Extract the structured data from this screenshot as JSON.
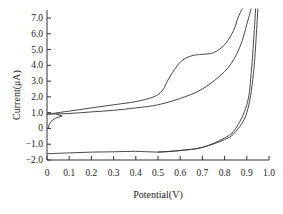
{
  "chart_data": {
    "type": "line",
    "title": "",
    "xlabel": "Potential(V)",
    "ylabel": "Current(μA)",
    "xlim": [
      0,
      1.0
    ],
    "ylim": [
      -2.0,
      7.0
    ],
    "x_ticks": [
      "0",
      "0.1",
      "0.2",
      "0.3",
      "0.4",
      "0.5",
      "0.6",
      "0.7",
      "0.8",
      "0.9",
      "1.0"
    ],
    "y_ticks": [
      "7.0",
      "6.0",
      "5.0",
      "4.0",
      "3.0",
      "2.0",
      "1.0",
      "0",
      "-1.0",
      "-2.0"
    ],
    "grid": false,
    "legend": null,
    "series": [
      {
        "name": "CV scan 1 (with oxidation peak)",
        "x": [
          0.0,
          0.05,
          0.1,
          0.2,
          0.3,
          0.4,
          0.48,
          0.52,
          0.55,
          0.6,
          0.65,
          0.7,
          0.75,
          0.8,
          0.84,
          0.86,
          0.88
        ],
        "y": [
          0.9,
          1.0,
          1.1,
          1.3,
          1.5,
          1.7,
          2.0,
          2.4,
          3.2,
          4.2,
          4.6,
          4.7,
          4.8,
          5.3,
          6.2,
          7.0,
          7.6
        ]
      },
      {
        "name": "CV scan 2 (return / baseline)",
        "x": [
          0.0,
          0.1,
          0.2,
          0.3,
          0.4,
          0.5,
          0.6,
          0.7,
          0.8,
          0.85,
          0.88,
          0.9,
          0.92
        ],
        "y": [
          0.9,
          0.95,
          1.05,
          1.15,
          1.3,
          1.5,
          1.9,
          2.5,
          3.6,
          4.6,
          5.6,
          6.6,
          7.6
        ]
      },
      {
        "name": "Cathodic scan",
        "x": [
          0.0,
          0.1,
          0.2,
          0.3,
          0.4,
          0.5,
          0.6,
          0.7,
          0.8,
          0.85,
          0.9,
          0.93,
          0.95
        ],
        "y": [
          -1.6,
          -1.55,
          -1.5,
          -1.48,
          -1.45,
          -1.5,
          -1.4,
          -1.2,
          -0.7,
          -0.2,
          1.0,
          3.5,
          7.6
        ]
      },
      {
        "name": "Anodic scan (high potential)",
        "x": [
          0.5,
          0.6,
          0.7,
          0.8,
          0.85,
          0.9,
          0.92,
          0.94
        ],
        "y": [
          -1.5,
          -1.4,
          -1.2,
          -0.6,
          0.0,
          1.5,
          3.5,
          7.6
        ]
      }
    ],
    "annotations": [
      "arrow on curve near (0.05, 1.0) indicating scan direction",
      "initial segment curving from ~0.2 up to 1.0 near x=0"
    ]
  }
}
